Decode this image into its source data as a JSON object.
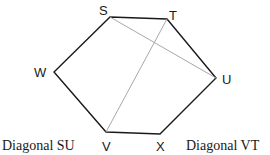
{
  "diagram": {
    "type": "hexagon-with-diagonals",
    "vertices": [
      {
        "name": "S",
        "x": 110,
        "y": 17,
        "label_x": 104,
        "label_y": 14
      },
      {
        "name": "T",
        "x": 167,
        "y": 19,
        "label_x": 173,
        "label_y": 19
      },
      {
        "name": "U",
        "x": 216,
        "y": 78,
        "label_x": 227,
        "label_y": 83
      },
      {
        "name": "X",
        "x": 160,
        "y": 134,
        "label_x": 161,
        "label_y": 152
      },
      {
        "name": "V",
        "x": 106,
        "y": 132,
        "label_x": 106,
        "label_y": 152
      },
      {
        "name": "W",
        "x": 54,
        "y": 72,
        "label_x": 40,
        "label_y": 77
      }
    ],
    "edge_color": "#1a1a1a",
    "diagonal_color": "#a8a8a8",
    "diagonals": [
      {
        "from": "S",
        "to": "U"
      },
      {
        "from": "V",
        "to": "T"
      }
    ],
    "captions": {
      "left": "Diagonal SU",
      "right": "Diagonal VT"
    }
  }
}
